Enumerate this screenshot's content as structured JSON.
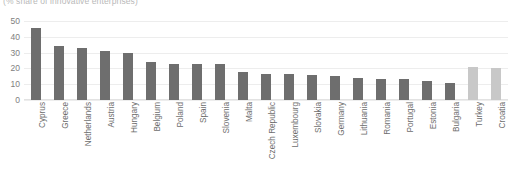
{
  "chart_data": {
    "type": "bar",
    "title": "",
    "subtitle": "(% share of innovative enterprises)",
    "xlabel": "",
    "ylabel": "",
    "ylim": [
      0,
      50
    ],
    "yticks": [
      0,
      10,
      20,
      30,
      40,
      50
    ],
    "grid": true,
    "legend": "none",
    "categories": [
      "Cyprus",
      "Greece",
      "Netherlands",
      "Austria",
      "Hungary",
      "Belgium",
      "Poland",
      "Spain",
      "Slovenia",
      "Malta",
      "Czech Republic",
      "Luxembourg",
      "Slovakia",
      "Germany",
      "Lithuania",
      "Romania",
      "Portugal",
      "Estonia",
      "Bulgaria",
      "Turkey",
      "Croatia"
    ],
    "values": [
      45.5,
      34.0,
      33.0,
      30.8,
      30.0,
      24.2,
      23.0,
      23.0,
      22.7,
      18.0,
      16.5,
      16.3,
      16.0,
      15.0,
      13.8,
      13.5,
      13.3,
      12.0,
      10.5,
      21.0,
      20.0
    ],
    "bar_colors": [
      "dark",
      "dark",
      "dark",
      "dark",
      "dark",
      "dark",
      "dark",
      "dark",
      "dark",
      "dark",
      "dark",
      "dark",
      "dark",
      "dark",
      "dark",
      "dark",
      "dark",
      "dark",
      "dark",
      "light",
      "light"
    ],
    "colors": {
      "bar_primary": "#6e6e6e",
      "bar_secondary": "#c8c8c8",
      "gridline": "#ededed",
      "axis_text": "#808080",
      "label_text": "#6d6d6d",
      "subtitle_text": "#b9b9b9",
      "background": "#ffffff"
    }
  }
}
